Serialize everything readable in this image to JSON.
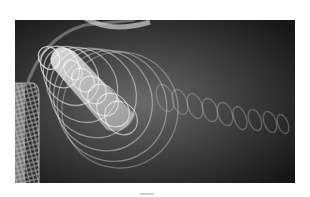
{
  "image": {
    "subject": "abstract 3D render of translucent spiral coils (springs) on dark gradient background",
    "background_colors": {
      "center": "#6a6a6a",
      "edge": "#161616",
      "page": "#ffffff"
    },
    "elements": [
      {
        "name": "large-cone-coil",
        "description": "bright white spiral cone pointing up-left"
      },
      {
        "name": "tail-helix",
        "description": "faint helix trailing to the right"
      },
      {
        "name": "left-mesh-tube",
        "description": "vertical mesh tube at left edge"
      },
      {
        "name": "top-curved-tube",
        "description": "curved tube crossing top-left corner"
      }
    ],
    "coil_color": "#f2f2f2"
  }
}
